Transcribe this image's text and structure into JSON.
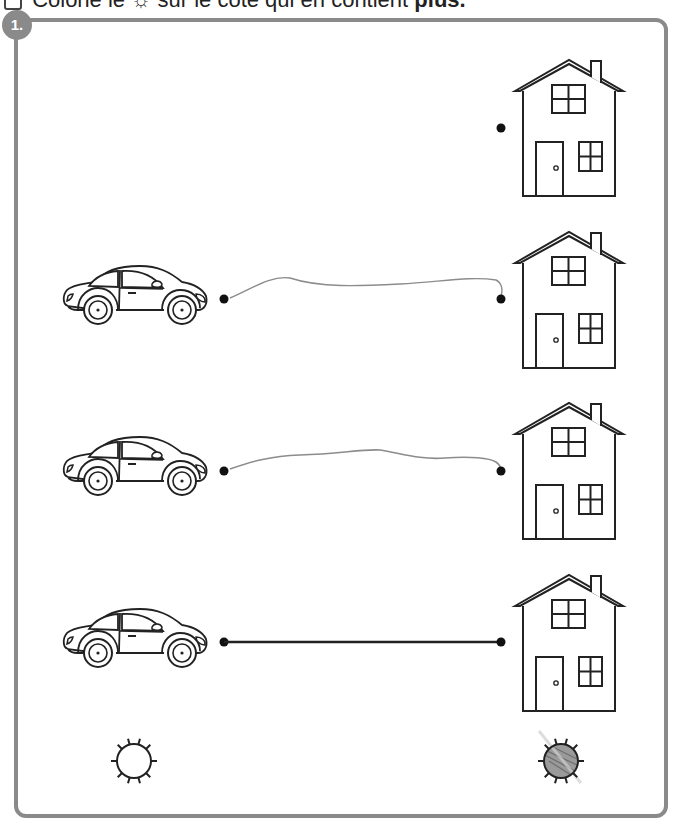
{
  "instruction": {
    "prefix": "Colorie le",
    "icon": "sun-icon",
    "middle": "sur le côté qui en contient",
    "emphasis": "plus."
  },
  "exercise": {
    "number": "1.",
    "frame_color": "#8a8a8a",
    "left_column": {
      "item": "car",
      "count": 3
    },
    "right_column": {
      "item": "house",
      "count": 4
    },
    "rows": [
      {
        "car": false,
        "house": true,
        "link": "none"
      },
      {
        "car": true,
        "house": true,
        "link": "pencil-curve"
      },
      {
        "car": true,
        "house": true,
        "link": "pencil-curve"
      },
      {
        "car": true,
        "house": true,
        "link": "straight"
      }
    ],
    "answer_suns": [
      {
        "side": "left",
        "colored": false
      },
      {
        "side": "right",
        "colored": true
      }
    ]
  }
}
